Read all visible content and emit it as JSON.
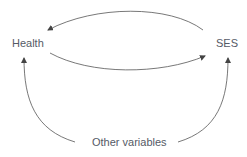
{
  "diagram": {
    "nodes": {
      "health": "Health",
      "ses": "SES",
      "other": "Other variables"
    },
    "edges": [
      {
        "from": "SES",
        "to": "Health"
      },
      {
        "from": "Health",
        "to": "SES"
      },
      {
        "from": "Other variables",
        "to": "Health"
      },
      {
        "from": "Other variables",
        "to": "SES"
      }
    ],
    "colors": {
      "text": "#555a66",
      "arrow": "#444444"
    }
  }
}
